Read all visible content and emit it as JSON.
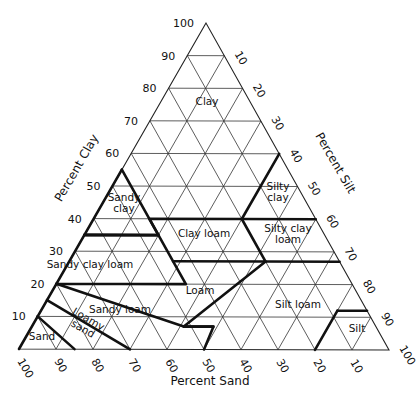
{
  "diagram": {
    "vertices": {
      "top": [
        206,
        23
      ],
      "bottom_left": [
        19,
        349
      ],
      "bottom_right": [
        389,
        350
      ]
    },
    "axes": {
      "clay": {
        "title": "Percent Clay",
        "ticks": [
          "10",
          "20",
          "30",
          "40",
          "50",
          "60",
          "70",
          "80",
          "90",
          "100"
        ]
      },
      "silt": {
        "title": "Percent Silt",
        "ticks": [
          "10",
          "20",
          "30",
          "40",
          "50",
          "60",
          "70",
          "80",
          "90",
          "100"
        ]
      },
      "sand": {
        "title": "Percent Sand",
        "ticks": [
          "100",
          "90",
          "80",
          "70",
          "60",
          "50",
          "40",
          "30",
          "20",
          "10"
        ]
      }
    },
    "grid_step": 10,
    "regions": [
      {
        "name": "Clay",
        "lines": [
          "Clay"
        ],
        "at": [
          207,
          105
        ]
      },
      {
        "name": "Silty clay",
        "lines": [
          "Silty",
          "clay"
        ],
        "at": [
          278,
          195
        ]
      },
      {
        "name": "Sandy clay",
        "lines": [
          "Sandy",
          "clay"
        ],
        "at": [
          124,
          206
        ]
      },
      {
        "name": "Clay loam",
        "lines": [
          "Clay loam"
        ],
        "at": [
          204,
          237
        ]
      },
      {
        "name": "Silty clay loam",
        "lines": [
          "Silty clay",
          "loam"
        ],
        "at": [
          288,
          237
        ]
      },
      {
        "name": "Sandy clay loam",
        "lines": [
          "Sandy clay loam"
        ],
        "at": [
          90,
          268
        ]
      },
      {
        "name": "Loam",
        "lines": [
          "Loam"
        ],
        "at": [
          200,
          294
        ]
      },
      {
        "name": "Silt loam",
        "lines": [
          "Silt loam"
        ],
        "at": [
          298,
          308
        ]
      },
      {
        "name": "Sandy loam",
        "lines": [
          "Sandy loam"
        ],
        "at": [
          120,
          313
        ]
      },
      {
        "name": "Loamy sand",
        "lines": [
          "Loamy",
          "sand"
        ],
        "at": [
          84,
          327
        ],
        "rotate": 30
      },
      {
        "name": "Sand",
        "lines": [
          "Sand"
        ],
        "at": [
          42,
          340
        ]
      },
      {
        "name": "Silt",
        "lines": [
          "Silt"
        ],
        "at": [
          357,
          332
        ]
      }
    ],
    "boundaries_clay_sand": [
      [
        [
          10,
          90
        ],
        [
          0,
          100
        ]
      ],
      [
        [
          10,
          90
        ],
        [
          0,
          85
        ]
      ],
      [
        [
          15,
          85
        ],
        [
          0,
          70
        ]
      ],
      [
        [
          15,
          85
        ],
        [
          10,
          90
        ]
      ],
      [
        [
          20,
          80
        ],
        [
          7,
          52
        ],
        [
          7,
          44
        ],
        [
          0,
          50
        ]
      ],
      [
        [
          20,
          80
        ],
        [
          15,
          85
        ]
      ],
      [
        [
          20,
          80
        ],
        [
          20,
          45
        ],
        [
          27,
          45
        ],
        [
          35,
          45
        ],
        [
          35,
          65
        ],
        [
          20,
          80
        ]
      ],
      [
        [
          35,
          65
        ],
        [
          35,
          45
        ],
        [
          40,
          45
        ],
        [
          40,
          20
        ],
        [
          60,
          0
        ]
      ],
      [
        [
          55,
          45
        ],
        [
          35,
          65
        ]
      ],
      [
        [
          35,
          45
        ],
        [
          55,
          45
        ]
      ],
      [
        [
          40,
          20
        ],
        [
          40,
          0
        ]
      ],
      [
        [
          27,
          45
        ],
        [
          27,
          20
        ],
        [
          40,
          20
        ]
      ],
      [
        [
          27,
          20
        ],
        [
          27,
          0
        ]
      ],
      [
        [
          12,
          8
        ],
        [
          12,
          0
        ]
      ],
      [
        [
          12,
          8
        ],
        [
          0,
          20
        ]
      ],
      [
        [
          27,
          20
        ],
        [
          7,
          52
        ]
      ],
      [
        [
          7,
          44
        ],
        [
          7,
          52
        ]
      ]
    ]
  }
}
